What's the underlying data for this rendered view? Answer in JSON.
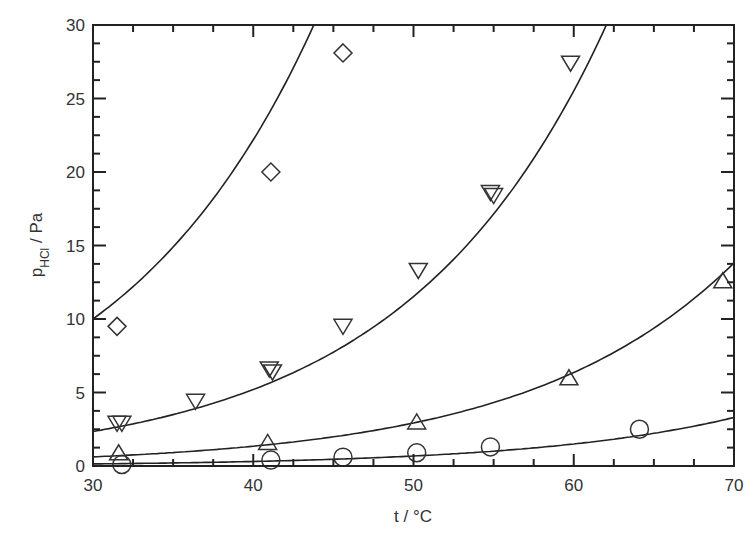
{
  "chart_data": {
    "type": "scatter",
    "title": "",
    "xlabel": "t / °C",
    "ylabel": "p_HCl / Pa",
    "ylabel_main": "p",
    "ylabel_sub": "HCl",
    "ylabel_unit": " / Pa",
    "xlim": [
      30,
      70
    ],
    "ylim": [
      0,
      30
    ],
    "xticks": [
      30,
      40,
      50,
      60,
      70
    ],
    "yticks": [
      0,
      5,
      10,
      15,
      20,
      25,
      30
    ],
    "x_minor_step": 2.5,
    "y_minor_step": 1.5,
    "grid": false,
    "legend": "none",
    "series": [
      {
        "name": "diamond",
        "marker": "diamond",
        "points": [
          [
            31.5,
            9.5
          ],
          [
            41.1,
            20.0
          ],
          [
            45.6,
            28.1
          ]
        ],
        "fit": {
          "a": 10.0,
          "b": 0.0797
        }
      },
      {
        "name": "triangle-down",
        "marker": "triangle-down",
        "points": [
          [
            31.5,
            2.9
          ],
          [
            31.8,
            2.9
          ],
          [
            36.4,
            4.4
          ],
          [
            41.0,
            6.6
          ],
          [
            41.2,
            6.4
          ],
          [
            45.6,
            9.5
          ],
          [
            50.3,
            13.3
          ],
          [
            54.8,
            18.6
          ],
          [
            55.0,
            18.4
          ],
          [
            59.8,
            27.4
          ]
        ],
        "fit": {
          "a": 2.35,
          "b": 0.0795
        }
      },
      {
        "name": "triangle-up",
        "marker": "triangle-up",
        "points": [
          [
            31.6,
            0.9
          ],
          [
            40.9,
            1.6
          ],
          [
            50.2,
            3.0
          ],
          [
            59.7,
            6.0
          ],
          [
            69.3,
            12.6
          ]
        ],
        "fit": {
          "a": 0.62,
          "b": 0.0776
        }
      },
      {
        "name": "circle",
        "marker": "circle",
        "points": [
          [
            31.8,
            0.1
          ],
          [
            41.1,
            0.4
          ],
          [
            45.6,
            0.6
          ],
          [
            50.2,
            0.9
          ],
          [
            54.8,
            1.3
          ],
          [
            64.1,
            2.5
          ]
        ],
        "fit": {
          "a": 0.14,
          "b": 0.079
        }
      }
    ]
  }
}
